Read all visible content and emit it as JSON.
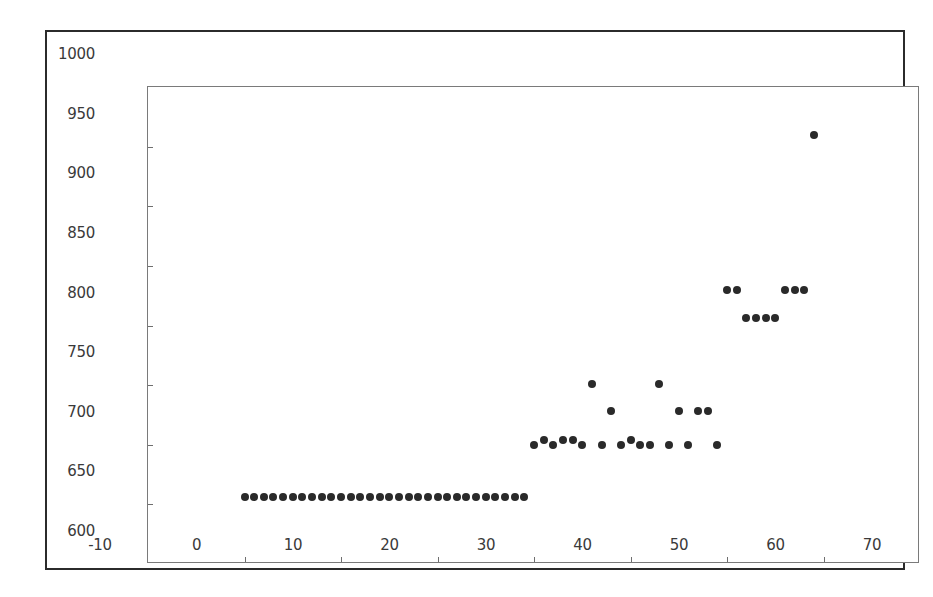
{
  "figure": {
    "background_color": "#ffffff",
    "marker_color": "#2a2a2a",
    "axis_color": "#7a7a7a",
    "frame_color": "#2b2b2b"
  },
  "chart_data": {
    "type": "scatter",
    "title": "",
    "xlabel": "",
    "ylabel": "",
    "xlim": [
      -10,
      70
    ],
    "ylim": [
      600,
      1000
    ],
    "xticks": [
      -10,
      0,
      10,
      20,
      30,
      40,
      50,
      60,
      70
    ],
    "yticks": [
      600,
      650,
      700,
      750,
      800,
      850,
      900,
      950,
      1000
    ],
    "xtick_labels": [
      "-10",
      "0",
      "10",
      "20",
      "30",
      "40",
      "50",
      "60",
      "70"
    ],
    "ytick_labels": [
      "600",
      "650",
      "700",
      "750",
      "800",
      "850",
      "900",
      "950",
      "1000"
    ],
    "grid": false,
    "legend": null,
    "marker_style": "filled-circle",
    "series": [
      {
        "name": "points",
        "x": [
          0,
          1,
          2,
          3,
          4,
          5,
          6,
          7,
          8,
          9,
          10,
          11,
          12,
          13,
          14,
          15,
          16,
          17,
          18,
          19,
          20,
          21,
          22,
          23,
          24,
          25,
          26,
          27,
          28,
          29,
          30,
          31,
          32,
          33,
          34,
          35,
          36,
          37,
          38,
          39,
          40,
          41,
          42,
          43,
          44,
          45,
          46,
          47,
          48,
          49,
          50,
          51,
          52,
          53,
          54,
          55,
          56,
          57,
          58,
          59
        ],
        "y": [
          656,
          656,
          656,
          656,
          656,
          656,
          656,
          656,
          656,
          656,
          656,
          656,
          656,
          656,
          656,
          656,
          656,
          656,
          656,
          656,
          656,
          656,
          656,
          656,
          656,
          656,
          656,
          656,
          656,
          656,
          700,
          704,
          700,
          704,
          704,
          700,
          751,
          700,
          728,
          700,
          704,
          700,
          700,
          751,
          700,
          728,
          700,
          728,
          728,
          700,
          830,
          830,
          806,
          806,
          806,
          806,
          830,
          830,
          830,
          960
        ]
      }
    ]
  }
}
